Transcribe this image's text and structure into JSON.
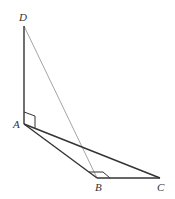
{
  "figure": {
    "type": "geometry",
    "points": {
      "D": {
        "label": "D",
        "x": 24,
        "y": 26,
        "label_x": 19,
        "label_y": 21
      },
      "A": {
        "label": "A",
        "x": 24,
        "y": 124,
        "label_x": 13,
        "label_y": 128
      },
      "B": {
        "label": "B",
        "x": 97,
        "y": 178,
        "label_x": 95,
        "label_y": 191
      },
      "C": {
        "label": "C",
        "x": 160,
        "y": 178,
        "label_x": 157,
        "label_y": 191
      }
    },
    "segments": [
      {
        "name": "DA",
        "from": "D",
        "to": "A",
        "style": "solid"
      },
      {
        "name": "AC",
        "from": "A",
        "to": "C",
        "style": "solid"
      },
      {
        "name": "AB",
        "from": "A",
        "to": "B",
        "style": "solid"
      },
      {
        "name": "BC",
        "from": "B",
        "to": "C",
        "style": "solid"
      },
      {
        "name": "DB",
        "from": "D",
        "to": "B",
        "style": "thin"
      }
    ],
    "right_angles": [
      {
        "at": "A",
        "between": [
          "AD",
          "AC"
        ]
      },
      {
        "at": "B",
        "between": [
          "BA",
          "BC"
        ]
      }
    ],
    "colors": {
      "stroke": "#333333",
      "thin_stroke": "#999999",
      "label": "#333333"
    }
  }
}
